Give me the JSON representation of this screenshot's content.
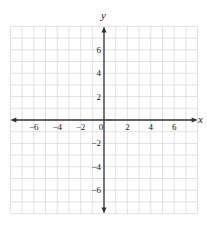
{
  "chart_data": {
    "type": "scatter",
    "title": "",
    "xlabel": "x",
    "ylabel": "y",
    "xlim": [
      -8,
      8
    ],
    "ylim": [
      -8,
      8
    ],
    "grid": true,
    "grid_step": 1,
    "x_ticks": [
      -6,
      -4,
      -2,
      0,
      2,
      4,
      6
    ],
    "x_tick_labels": [
      "−6",
      "−4",
      "−2",
      "0",
      "2",
      "4",
      "6"
    ],
    "y_ticks": [
      6,
      4,
      2,
      -2,
      -4,
      -6
    ],
    "y_tick_labels": [
      "6",
      "4",
      "2",
      "−2",
      "−4",
      "−6"
    ],
    "series": [],
    "legend": null
  },
  "colors": {
    "grid": "#d9d9d9",
    "axis": "#333333",
    "text": "#222222"
  }
}
